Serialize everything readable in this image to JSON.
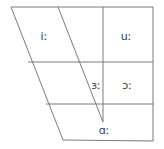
{
  "figure": {
    "name": "vowel-quadrilateral",
    "background_color": "#ffffff",
    "line_color": "#7a7a7a",
    "text_color": "#3a3a3a"
  },
  "vowels": [
    {
      "symbol": "iː",
      "name": "vowel-i-long",
      "x": 44,
      "y": 36
    },
    {
      "symbol": "uː",
      "name": "vowel-u-long",
      "x": 126,
      "y": 36
    },
    {
      "symbol": "ɜː",
      "name": "vowel-open-mid-central-long",
      "x": 96,
      "y": 85
    },
    {
      "symbol": "ɔː",
      "name": "vowel-open-mid-back-long",
      "x": 127,
      "y": 85
    },
    {
      "symbol": "ɑː",
      "name": "vowel-open-back-long",
      "x": 104,
      "y": 130
    }
  ],
  "outline": {
    "name": "quadrilateral-outline",
    "points": "11,7 153,7 153,141 63,140"
  },
  "dividers": [
    {
      "name": "horizontal-divider-upper",
      "x1": 28,
      "y1": 62,
      "x2": 153,
      "y2": 62
    },
    {
      "name": "horizontal-divider-lower",
      "x1": 46,
      "y1": 104,
      "x2": 153,
      "y2": 104
    },
    {
      "name": "diagonal-front-central",
      "x1": 58,
      "y1": 7,
      "x2": 103,
      "y2": 122
    },
    {
      "name": "vertical-central-back",
      "x1": 103,
      "y1": 7,
      "x2": 103,
      "y2": 122
    }
  ]
}
